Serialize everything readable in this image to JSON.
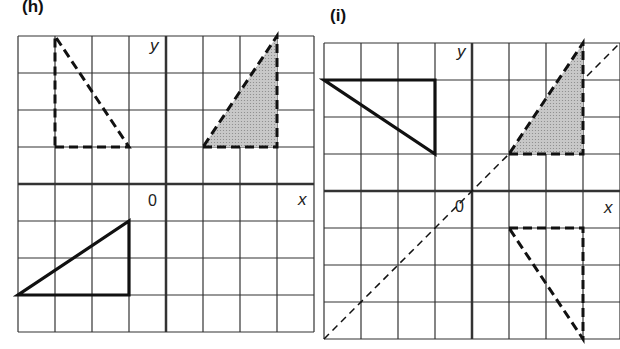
{
  "panels": [
    {
      "id": "h",
      "label": "(h)",
      "x_axis_label": "x",
      "y_axis_label": "y",
      "origin_label": "0",
      "grid": {
        "cols": 8,
        "rows": 8,
        "x_range": [
          -4,
          4
        ],
        "y_range": [
          -4,
          4
        ]
      },
      "shapes": [
        {
          "name": "object-triangle",
          "style": "solid",
          "fill": "none",
          "vertices": [
            [
              -4,
              -3
            ],
            [
              -1,
              -3
            ],
            [
              -1,
              -1
            ]
          ]
        },
        {
          "name": "image-triangle-shaded",
          "style": "dashed",
          "fill": "shaded",
          "vertices": [
            [
              1,
              1
            ],
            [
              3,
              1
            ],
            [
              3,
              4
            ]
          ]
        },
        {
          "name": "image-triangle-dashed",
          "style": "dashed",
          "fill": "none",
          "vertices": [
            [
              -3,
              1
            ],
            [
              -1,
              1
            ],
            [
              -3,
              4
            ]
          ]
        }
      ]
    },
    {
      "id": "i",
      "label": "(i)",
      "x_axis_label": "x",
      "y_axis_label": "y",
      "origin_label": "0",
      "grid": {
        "cols": 8,
        "rows": 8,
        "x_range": [
          -4,
          4
        ],
        "y_range": [
          -4,
          4
        ]
      },
      "mirror_line": "y = x",
      "shapes": [
        {
          "name": "object-triangle",
          "style": "solid",
          "fill": "none",
          "vertices": [
            [
              -4,
              3
            ],
            [
              -1,
              3
            ],
            [
              -1,
              1
            ]
          ]
        },
        {
          "name": "image-triangle-shaded",
          "style": "dashed",
          "fill": "shaded",
          "vertices": [
            [
              1,
              1
            ],
            [
              3,
              1
            ],
            [
              3,
              4
            ]
          ]
        },
        {
          "name": "image-triangle-dashed",
          "style": "dashed",
          "fill": "none",
          "vertices": [
            [
              1,
              -1
            ],
            [
              3,
              -1
            ],
            [
              3,
              -4
            ]
          ]
        }
      ]
    }
  ],
  "colors": {
    "grid": "#333333",
    "ink": "#111111",
    "shade": "#c8c8c8"
  }
}
